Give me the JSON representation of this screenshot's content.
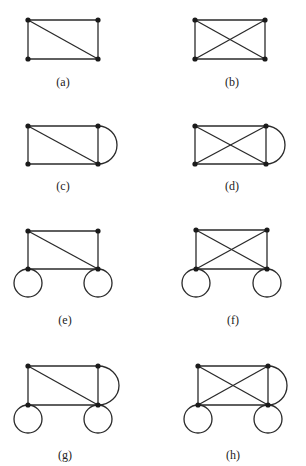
{
  "figure": {
    "panels": [
      {
        "id": "a",
        "label": "(a)",
        "nodes": [
          [
            28,
            20
          ],
          [
            98,
            20
          ],
          [
            28,
            59
          ],
          [
            98,
            59
          ]
        ],
        "edges": [
          [
            0,
            1
          ],
          [
            0,
            2
          ],
          [
            1,
            3
          ],
          [
            2,
            3
          ],
          [
            0,
            3
          ]
        ],
        "arcs": [],
        "loops": [],
        "label_pos": [
          63,
          86
        ]
      },
      {
        "id": "b",
        "label": "(b)",
        "nodes": [
          [
            195,
            20
          ],
          [
            265,
            20
          ],
          [
            195,
            59
          ],
          [
            265,
            59
          ]
        ],
        "edges": [
          [
            0,
            1
          ],
          [
            0,
            2
          ],
          [
            1,
            3
          ],
          [
            2,
            3
          ],
          [
            0,
            3
          ],
          [
            1,
            2
          ]
        ],
        "arcs": [],
        "loops": [],
        "label_pos": [
          232,
          86
        ]
      },
      {
        "id": "c",
        "label": "(c)",
        "nodes": [
          [
            28,
            126
          ],
          [
            98,
            126
          ],
          [
            28,
            164
          ],
          [
            98,
            164
          ]
        ],
        "edges": [
          [
            0,
            1
          ],
          [
            0,
            2
          ],
          [
            1,
            3
          ],
          [
            2,
            3
          ],
          [
            0,
            3
          ]
        ],
        "arcs": [
          [
            1,
            3,
            117
          ]
        ],
        "loops": [],
        "label_pos": [
          63,
          190
        ]
      },
      {
        "id": "d",
        "label": "(d)",
        "nodes": [
          [
            195,
            126
          ],
          [
            266,
            126
          ],
          [
            195,
            164
          ],
          [
            266,
            164
          ]
        ],
        "edges": [
          [
            0,
            1
          ],
          [
            0,
            2
          ],
          [
            1,
            3
          ],
          [
            2,
            3
          ],
          [
            0,
            3
          ],
          [
            1,
            2
          ]
        ],
        "arcs": [
          [
            1,
            3,
            285
          ]
        ],
        "loops": [],
        "label_pos": [
          232,
          190
        ]
      },
      {
        "id": "e",
        "label": "(e)",
        "nodes": [
          [
            28,
            231
          ],
          [
            98,
            231
          ],
          [
            28,
            269
          ],
          [
            98,
            269
          ]
        ],
        "edges": [
          [
            0,
            1
          ],
          [
            0,
            2
          ],
          [
            1,
            3
          ],
          [
            2,
            3
          ],
          [
            0,
            3
          ]
        ],
        "arcs": [],
        "loops": [
          [
            2,
            14
          ],
          [
            3,
            14
          ]
        ],
        "label_pos": [
          65,
          324
        ]
      },
      {
        "id": "f",
        "label": "(f)",
        "nodes": [
          [
            196,
            230
          ],
          [
            267,
            230
          ],
          [
            196,
            269
          ],
          [
            267,
            269
          ]
        ],
        "edges": [
          [
            0,
            1
          ],
          [
            0,
            2
          ],
          [
            1,
            3
          ],
          [
            2,
            3
          ],
          [
            0,
            3
          ],
          [
            1,
            2
          ]
        ],
        "arcs": [],
        "loops": [
          [
            2,
            14
          ],
          [
            3,
            14
          ]
        ],
        "label_pos": [
          233,
          324
        ]
      },
      {
        "id": "g",
        "label": "(g)",
        "nodes": [
          [
            28,
            366
          ],
          [
            98,
            366
          ],
          [
            28,
            405
          ],
          [
            98,
            405
          ]
        ],
        "edges": [
          [
            0,
            1
          ],
          [
            0,
            2
          ],
          [
            1,
            3
          ],
          [
            2,
            3
          ],
          [
            0,
            3
          ]
        ],
        "arcs": [
          [
            1,
            3,
            119
          ]
        ],
        "loops": [
          [
            2,
            14
          ],
          [
            3,
            14
          ]
        ],
        "label_pos": [
          65,
          459
        ]
      },
      {
        "id": "h",
        "label": "(h)",
        "nodes": [
          [
            198,
            366
          ],
          [
            268,
            366
          ],
          [
            198,
            405
          ],
          [
            268,
            405
          ]
        ],
        "edges": [
          [
            0,
            1
          ],
          [
            0,
            2
          ],
          [
            1,
            3
          ],
          [
            2,
            3
          ],
          [
            0,
            3
          ],
          [
            1,
            2
          ]
        ],
        "arcs": [
          [
            1,
            3,
            287
          ]
        ],
        "loops": [
          [
            2,
            14
          ],
          [
            3,
            14
          ]
        ],
        "label_pos": [
          233,
          459
        ]
      }
    ]
  }
}
